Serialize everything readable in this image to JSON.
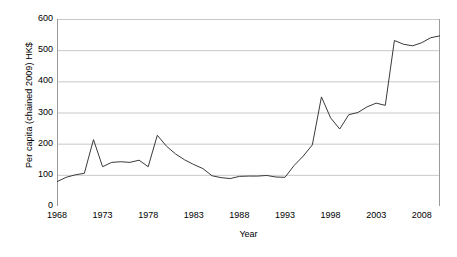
{
  "chart_data": {
    "type": "line",
    "title": "",
    "xlabel": "Year",
    "ylabel": "Per capita (chained 2009) HK$",
    "xlim": [
      1968,
      2010
    ],
    "ylim": [
      0,
      600
    ],
    "grid": true,
    "legend": false,
    "y_ticks": [
      0,
      100,
      200,
      300,
      400,
      500,
      600
    ],
    "y_tick_labels": [
      "0",
      "100",
      "200",
      "300",
      "400",
      "500",
      "600"
    ],
    "x_ticks": [
      1968,
      1973,
      1978,
      1983,
      1988,
      1993,
      1998,
      2003,
      2008
    ],
    "x_tick_labels": [
      "1968",
      "1973",
      "1978",
      "1983",
      "1988",
      "1993",
      "1998",
      "2003",
      "2008"
    ],
    "line_color": "#3a3a3a",
    "grid_color": "#c8c8c8",
    "axis_color": "#9a9a9a",
    "x": [
      1968,
      1969,
      1970,
      1971,
      1972,
      1973,
      1974,
      1975,
      1976,
      1977,
      1978,
      1979,
      1980,
      1981,
      1982,
      1983,
      1984,
      1985,
      1986,
      1987,
      1988,
      1989,
      1990,
      1991,
      1992,
      1993,
      1994,
      1995,
      1996,
      1997,
      1998,
      1999,
      2000,
      2001,
      2002,
      2003,
      2004,
      2005,
      2006,
      2007,
      2008,
      2009,
      2010
    ],
    "values": [
      78,
      92,
      100,
      105,
      213,
      126,
      140,
      142,
      140,
      147,
      126,
      227,
      195,
      168,
      147,
      134,
      122,
      97,
      91,
      88,
      95,
      96,
      96,
      97,
      93,
      92,
      128,
      160,
      196,
      350,
      282,
      247,
      292,
      300,
      318,
      330,
      323,
      531,
      519,
      514,
      524,
      540,
      546
    ],
    "series": [
      {
        "name": "Per capita (chained 2009) HK$",
        "points": [
          {
            "year": 1968,
            "value": 78
          },
          {
            "year": 1969,
            "value": 92
          },
          {
            "year": 1970,
            "value": 100
          },
          {
            "year": 1971,
            "value": 105
          },
          {
            "year": 1972,
            "value": 213
          },
          {
            "year": 1973,
            "value": 126
          },
          {
            "year": 1974,
            "value": 140
          },
          {
            "year": 1975,
            "value": 142
          },
          {
            "year": 1976,
            "value": 140
          },
          {
            "year": 1977,
            "value": 147
          },
          {
            "year": 1978,
            "value": 126
          },
          {
            "year": 1979,
            "value": 227
          },
          {
            "year": 1980,
            "value": 195
          },
          {
            "year": 1981,
            "value": 168
          },
          {
            "year": 1982,
            "value": 147
          },
          {
            "year": 1983,
            "value": 134
          },
          {
            "year": 1984,
            "value": 122
          },
          {
            "year": 1985,
            "value": 97
          },
          {
            "year": 1986,
            "value": 91
          },
          {
            "year": 1987,
            "value": 88
          },
          {
            "year": 1988,
            "value": 95
          },
          {
            "year": 1989,
            "value": 96
          },
          {
            "year": 1990,
            "value": 96
          },
          {
            "year": 1991,
            "value": 97
          },
          {
            "year": 1992,
            "value": 93
          },
          {
            "year": 1993,
            "value": 92
          },
          {
            "year": 1994,
            "value": 128
          },
          {
            "year": 1995,
            "value": 160
          },
          {
            "year": 1996,
            "value": 196
          },
          {
            "year": 1997,
            "value": 350
          },
          {
            "year": 1998,
            "value": 282
          },
          {
            "year": 1999,
            "value": 247
          },
          {
            "year": 2000,
            "value": 292
          },
          {
            "year": 2001,
            "value": 300
          },
          {
            "year": 2002,
            "value": 318
          },
          {
            "year": 2003,
            "value": 330
          },
          {
            "year": 2004,
            "value": 323
          },
          {
            "year": 2005,
            "value": 531
          },
          {
            "year": 2006,
            "value": 519
          },
          {
            "year": 2007,
            "value": 514
          },
          {
            "year": 2008,
            "value": 524
          },
          {
            "year": 2009,
            "value": 540
          },
          {
            "year": 2010,
            "value": 546
          }
        ]
      }
    ],
    "plot_points": [
      {
        "year": 1968,
        "value": 78
      },
      {
        "year": 1969,
        "value": 92
      },
      {
        "year": 1970,
        "value": 100
      },
      {
        "year": 1971,
        "value": 105
      },
      {
        "year": 1972,
        "value": 213
      },
      {
        "year": 1973,
        "value": 126
      },
      {
        "year": 1974,
        "value": 140
      },
      {
        "year": 1975,
        "value": 142
      },
      {
        "year": 1976,
        "value": 140
      },
      {
        "year": 1977,
        "value": 147
      },
      {
        "year": 1978,
        "value": 126
      },
      {
        "year": 1979,
        "value": 227
      },
      {
        "year": 1980,
        "value": 192
      },
      {
        "year": 1981,
        "value": 167
      },
      {
        "year": 1982,
        "value": 148
      },
      {
        "year": 1983,
        "value": 133
      },
      {
        "year": 1984,
        "value": 120
      },
      {
        "year": 1985,
        "value": 97
      },
      {
        "year": 1986,
        "value": 91
      },
      {
        "year": 1987,
        "value": 88
      },
      {
        "year": 1988,
        "value": 95
      },
      {
        "year": 1989,
        "value": 96
      },
      {
        "year": 1990,
        "value": 96
      },
      {
        "year": 1991,
        "value": 98
      },
      {
        "year": 1992,
        "value": 93
      },
      {
        "year": 1993,
        "value": 92
      },
      {
        "year": 1994,
        "value": 130
      },
      {
        "year": 1995,
        "value": 160
      },
      {
        "year": 1996,
        "value": 196
      },
      {
        "year": 1997,
        "value": 350
      },
      {
        "year": 1998,
        "value": 283
      },
      {
        "year": 1999,
        "value": 247
      },
      {
        "year": 2000,
        "value": 293
      },
      {
        "year": 2001,
        "value": 300
      },
      {
        "year": 2002,
        "value": 318
      },
      {
        "year": 2003,
        "value": 330
      },
      {
        "year": 2004,
        "value": 323
      },
      {
        "year": 2005,
        "value": 531
      },
      {
        "year": 2006,
        "value": 519
      },
      {
        "year": 2007,
        "value": 514
      },
      {
        "year": 2008,
        "value": 524
      },
      {
        "year": 2009,
        "value": 540
      },
      {
        "year": 2010,
        "value": 546
      }
    ]
  }
}
